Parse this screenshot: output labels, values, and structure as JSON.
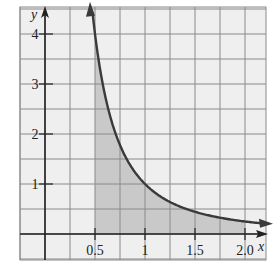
{
  "chart_data": {
    "type": "area",
    "title": "",
    "function": "y = 1/x^2",
    "xlabel": "x",
    "ylabel": "y",
    "xlim": [
      -0.5,
      2.25
    ],
    "ylim": [
      -0.5,
      4.5
    ],
    "grid": true,
    "grid_step_x": 0.25,
    "grid_step_y": 0.5,
    "x_ticks": [
      0.5,
      1,
      1.5,
      2.0
    ],
    "x_tick_labels": [
      "0.5",
      "1",
      "1.5",
      "2.0"
    ],
    "y_ticks": [
      1,
      2,
      3,
      4
    ],
    "y_tick_labels": [
      "1",
      "2",
      "3",
      "4"
    ],
    "shaded_region": {
      "x_from": 0.5,
      "x_to": 2.0,
      "under": "curve"
    },
    "series": [
      {
        "name": "y = 1/x^2",
        "x": [
          0.47,
          0.5,
          0.6,
          0.7,
          0.8,
          1.0,
          1.25,
          1.5,
          1.75,
          2.0,
          2.25
        ],
        "values": [
          4.5,
          4.0,
          2.78,
          2.04,
          1.56,
          1.0,
          0.64,
          0.44,
          0.33,
          0.25,
          0.2
        ]
      }
    ],
    "colors": {
      "grid": "#8a8a8a",
      "axis": "#222222",
      "curve": "#3a3a3a",
      "shade": "#c9c9c9",
      "background": "#eeeeee"
    }
  }
}
